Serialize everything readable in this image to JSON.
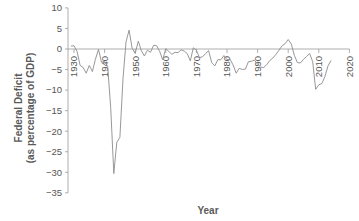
{
  "chart_data": {
    "type": "line",
    "title": "",
    "xlabel": "Year",
    "ylabel": "Federal Deficit (as percentage of GDP)",
    "ylabel_lines": [
      "Federal Deficit",
      "(as percentage of GDP)"
    ],
    "xlim": [
      1928,
      2020
    ],
    "ylim": [
      -35,
      10
    ],
    "x_ticks": [
      1930,
      1940,
      1950,
      1960,
      1970,
      1980,
      1990,
      2000,
      2010,
      2020
    ],
    "y_ticks": [
      10,
      5,
      0,
      -5,
      -10,
      -15,
      -20,
      -25,
      -30,
      -35
    ],
    "y_tick_labels": [
      "10",
      "5",
      "0",
      "−5",
      "−10",
      "−15",
      "−20",
      "−25",
      "−30",
      "−35"
    ],
    "grid": false,
    "legend": null,
    "series": [
      {
        "name": "Federal Deficit",
        "color": "#8c8c8c",
        "x": [
          1929,
          1930,
          1931,
          1932,
          1933,
          1934,
          1935,
          1936,
          1937,
          1938,
          1939,
          1940,
          1941,
          1942,
          1943,
          1944,
          1945,
          1946,
          1947,
          1948,
          1949,
          1950,
          1951,
          1952,
          1953,
          1954,
          1955,
          1956,
          1957,
          1958,
          1959,
          1960,
          1961,
          1962,
          1963,
          1964,
          1965,
          1966,
          1967,
          1968,
          1969,
          1970,
          1971,
          1972,
          1973,
          1974,
          1975,
          1976,
          1977,
          1978,
          1979,
          1980,
          1981,
          1982,
          1983,
          1984,
          1985,
          1986,
          1987,
          1988,
          1989,
          1990,
          1991,
          1992,
          1993,
          1994,
          1995,
          1996,
          1997,
          1998,
          1999,
          2000,
          2001,
          2002,
          2003,
          2004,
          2005,
          2006,
          2007,
          2008,
          2009,
          2010,
          2011,
          2012,
          2013,
          2014
        ],
        "values": [
          0.7,
          0.8,
          -0.6,
          -4.0,
          -4.5,
          -5.9,
          -4.0,
          -5.5,
          -2.5,
          -0.1,
          -3.2,
          -3.0,
          -4.3,
          -14.2,
          -30.3,
          -22.7,
          -21.5,
          -7.2,
          1.7,
          4.6,
          0.2,
          -1.1,
          1.9,
          -0.4,
          -1.7,
          -0.3,
          -0.8,
          0.9,
          0.8,
          -0.6,
          -2.6,
          0.1,
          -0.6,
          -1.3,
          -0.8,
          -0.9,
          -0.2,
          -0.5,
          -1.1,
          -2.9,
          0.3,
          -0.3,
          -2.1,
          -1.9,
          -1.1,
          -0.4,
          -3.3,
          -4.1,
          -2.6,
          -2.6,
          -1.6,
          -2.6,
          -2.5,
          -3.9,
          -5.9,
          -4.7,
          -5.0,
          -4.9,
          -3.1,
          -3.0,
          -2.7,
          -3.7,
          -4.4,
          -4.5,
          -3.8,
          -2.8,
          -2.2,
          -1.3,
          -0.3,
          0.8,
          1.3,
          2.3,
          1.2,
          -1.5,
          -3.3,
          -3.4,
          -2.5,
          -1.8,
          -1.1,
          -3.1,
          -9.8,
          -8.7,
          -8.4,
          -6.7,
          -4.1,
          -2.8
        ]
      }
    ],
    "layout": {
      "x_axis_at_y": 0,
      "x_tick_label_rotation": -90,
      "axis_color": "#9a9a9a",
      "text_color": "#555555"
    }
  }
}
